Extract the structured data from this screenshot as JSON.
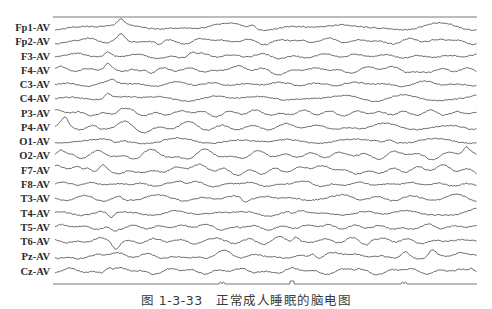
{
  "chart_data": {
    "type": "line",
    "title": "",
    "caption": "图 1-3-33　正常成人睡眠的脑电图",
    "xlabel": "",
    "ylabel": "",
    "montage": "average reference (AV)",
    "grid": false,
    "legend": "none",
    "x_range_px": [
      53,
      477
    ],
    "channels": [
      {
        "label": "Fp1-AV",
        "y": 27,
        "amp": 3.0,
        "seed": 11,
        "spikes": [
          [
            121,
            -6
          ],
          [
            253,
            -4
          ]
        ]
      },
      {
        "label": "Fp2-AV",
        "y": 41,
        "amp": 3.0,
        "seed": 23,
        "spikes": [
          [
            121,
            -5
          ],
          [
            160,
            3
          ]
        ]
      },
      {
        "label": "F3-AV",
        "y": 56,
        "amp": 2.8,
        "seed": 37,
        "spikes": [
          [
            108,
            -4
          ],
          [
            191,
            -3
          ]
        ]
      },
      {
        "label": "F4-AV",
        "y": 70,
        "amp": 3.0,
        "seed": 41,
        "spikes": [
          [
            108,
            -5
          ],
          [
            145,
            -3
          ]
        ]
      },
      {
        "label": "C3-AV",
        "y": 84,
        "amp": 2.6,
        "seed": 53,
        "spikes": [
          [
            112,
            -3
          ]
        ]
      },
      {
        "label": "C4-AV",
        "y": 98,
        "amp": 2.6,
        "seed": 67,
        "spikes": [
          [
            108,
            -5
          ]
        ]
      },
      {
        "label": "P3-AV",
        "y": 113,
        "amp": 2.6,
        "seed": 71,
        "spikes": [
          [
            120,
            -3
          ]
        ]
      },
      {
        "label": "P4-AV",
        "y": 127,
        "amp": 3.2,
        "seed": 83,
        "spikes": [
          [
            65,
            -6
          ],
          [
            100,
            3
          ]
        ]
      },
      {
        "label": "O1-AV",
        "y": 141,
        "amp": 3.0,
        "seed": 97,
        "spikes": [
          [
            116,
            3
          ],
          [
            390,
            -3
          ]
        ]
      },
      {
        "label": "O2-AV",
        "y": 155,
        "amp": 4.2,
        "seed": 101,
        "spikes": [
          [
            60,
            -5
          ],
          [
            466,
            -6
          ]
        ]
      },
      {
        "label": "F7-AV",
        "y": 170,
        "amp": 3.8,
        "seed": 113,
        "spikes": [
          [
            103,
            -5
          ],
          [
            82,
            4
          ]
        ]
      },
      {
        "label": "F8-AV",
        "y": 184,
        "amp": 2.2,
        "seed": 127,
        "spikes": [
          [
            180,
            -2
          ]
        ]
      },
      {
        "label": "T3-AV",
        "y": 198,
        "amp": 3.0,
        "seed": 131,
        "spikes": [
          [
            125,
            3
          ],
          [
            245,
            3
          ]
        ]
      },
      {
        "label": "T4-AV",
        "y": 213,
        "amp": 3.2,
        "seed": 149,
        "spikes": [
          [
            111,
            6
          ],
          [
            293,
            3
          ]
        ]
      },
      {
        "label": "T5-AV",
        "y": 227,
        "amp": 2.6,
        "seed": 157,
        "spikes": [
          [
            114,
            3
          ]
        ]
      },
      {
        "label": "T6-AV",
        "y": 241,
        "amp": 3.6,
        "seed": 163,
        "spikes": [
          [
            116,
            6
          ],
          [
            296,
            -6
          ],
          [
            372,
            -4
          ]
        ]
      },
      {
        "label": "Pz-AV",
        "y": 256,
        "amp": 3.2,
        "seed": 173,
        "spikes": [
          [
            313,
            -5
          ],
          [
            405,
            -4
          ],
          [
            432,
            -5
          ]
        ]
      },
      {
        "label": "Cz-AV",
        "y": 271,
        "amp": 3.0,
        "seed": 181,
        "spikes": [
          [
            108,
            -5
          ],
          [
            472,
            -4
          ]
        ]
      }
    ],
    "top_line_y": 17,
    "time_marker": {
      "y": 284,
      "events": [
        {
          "x": 222,
          "type": "double-bump"
        },
        {
          "x": 292,
          "type": "block"
        },
        {
          "x": 404,
          "type": "double-bump"
        }
      ]
    }
  }
}
